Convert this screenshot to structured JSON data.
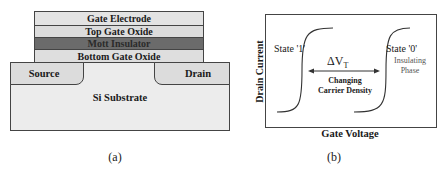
{
  "panel_a": {
    "caption": "(a)",
    "layers": [
      {
        "label": "Gate Electrode",
        "color": "#e3e3e3"
      },
      {
        "label": "Top Gate Oxide",
        "color": "#dcdcdc"
      },
      {
        "label": "Mott Insulator",
        "color": "#6b6b6b"
      },
      {
        "label": "Bottom Gate Oxide",
        "color": "#dedede"
      }
    ],
    "source_label": "Source",
    "drain_label": "Drain",
    "substrate_label": "Si Substrate",
    "substrate_color": "#ececec",
    "contact_color": "#dcdcdc"
  },
  "panel_b": {
    "caption": "(b)",
    "x_axis_label": "Gate Voltage",
    "y_axis_label": "Drain Current",
    "state1_label": "State '1'",
    "state0_label": "State '0'",
    "state0_sub1": "Insulating",
    "state0_sub2": "Phase",
    "delta_symbol": "ΔV",
    "delta_subscript": "T",
    "arrow_label_1": "Changing",
    "arrow_label_2": "Carrier Density"
  }
}
